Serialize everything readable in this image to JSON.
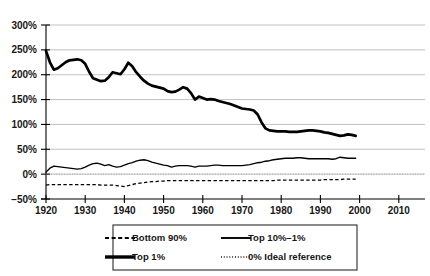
{
  "chart_data": {
    "type": "line",
    "title": "",
    "subtitle": "",
    "xlabel": "",
    "ylabel": "",
    "xlim": [
      1918,
      2012
    ],
    "ylim": [
      -50,
      300
    ],
    "grid": true,
    "legend_position": "bottom-center",
    "y_ticks": [
      {
        "value": 300,
        "label": "300%"
      },
      {
        "value": 250,
        "label": "250%"
      },
      {
        "value": 200,
        "label": "200%"
      },
      {
        "value": 150,
        "label": "150%"
      },
      {
        "value": 100,
        "label": "100%"
      },
      {
        "value": 50,
        "label": "50%"
      },
      {
        "value": 0,
        "label": "0%"
      },
      {
        "value": -50,
        "label": "−50%"
      }
    ],
    "x_ticks": [
      {
        "value": 1920,
        "label": "1920"
      },
      {
        "value": 1930,
        "label": "1930"
      },
      {
        "value": 1940,
        "label": "1940"
      },
      {
        "value": 1950,
        "label": "1950"
      },
      {
        "value": 1960,
        "label": "1960"
      },
      {
        "value": 1970,
        "label": "1970"
      },
      {
        "value": 1980,
        "label": "1980"
      },
      {
        "value": 1990,
        "label": "1990"
      },
      {
        "value": 2000,
        "label": "2000"
      },
      {
        "value": 2010,
        "label": "2010"
      }
    ],
    "series": [
      {
        "name": "Top 1%",
        "key": "top1",
        "style": "solid-thick",
        "x": [
          1920,
          1921,
          1922,
          1923,
          1924,
          1925,
          1926,
          1927,
          1928,
          1929,
          1930,
          1931,
          1932,
          1933,
          1934,
          1935,
          1936,
          1937,
          1938,
          1939,
          1940,
          1941,
          1942,
          1943,
          1944,
          1945,
          1946,
          1947,
          1948,
          1949,
          1950,
          1951,
          1952,
          1953,
          1954,
          1955,
          1956,
          1957,
          1958,
          1959,
          1960,
          1961,
          1962,
          1963,
          1964,
          1965,
          1966,
          1967,
          1968,
          1969,
          1970,
          1971,
          1972,
          1973,
          1974,
          1975,
          1976,
          1977,
          1978,
          1979,
          1980,
          1981,
          1982,
          1983,
          1984,
          1985,
          1986,
          1987,
          1988,
          1989,
          1990,
          1991,
          1992,
          1993,
          1994,
          1995,
          1996,
          1997,
          1998,
          1999
        ],
        "values": [
          248,
          225,
          210,
          213,
          219,
          225,
          229,
          230,
          231,
          229,
          222,
          206,
          193,
          190,
          187,
          188,
          195,
          205,
          203,
          201,
          211,
          224,
          217,
          205,
          196,
          188,
          182,
          178,
          176,
          174,
          172,
          167,
          165,
          166,
          170,
          175,
          172,
          163,
          150,
          156,
          153,
          150,
          151,
          150,
          147,
          145,
          143,
          141,
          138,
          135,
          132,
          131,
          130,
          128,
          120,
          104,
          92,
          88,
          87,
          86,
          86,
          86,
          85,
          85,
          85,
          86,
          87,
          88,
          88,
          87,
          86,
          84,
          83,
          81,
          79,
          77,
          78,
          80,
          79,
          77
        ]
      },
      {
        "name": "Top 10%–1%",
        "key": "top10_1",
        "style": "solid-thin",
        "x": [
          1920,
          1921,
          1922,
          1923,
          1924,
          1925,
          1926,
          1927,
          1928,
          1929,
          1930,
          1931,
          1932,
          1933,
          1934,
          1935,
          1936,
          1937,
          1938,
          1939,
          1940,
          1941,
          1942,
          1943,
          1944,
          1945,
          1946,
          1947,
          1948,
          1949,
          1950,
          1951,
          1952,
          1953,
          1954,
          1955,
          1956,
          1957,
          1958,
          1959,
          1960,
          1961,
          1962,
          1963,
          1964,
          1965,
          1966,
          1967,
          1968,
          1969,
          1970,
          1971,
          1972,
          1973,
          1974,
          1975,
          1976,
          1977,
          1978,
          1979,
          1980,
          1981,
          1982,
          1983,
          1984,
          1985,
          1986,
          1987,
          1988,
          1989,
          1990,
          1991,
          1992,
          1993,
          1994,
          1995,
          1996,
          1997,
          1998,
          1999
        ],
        "values": [
          4,
          12,
          16,
          15,
          14,
          13,
          12,
          11,
          10,
          11,
          14,
          18,
          21,
          22,
          20,
          17,
          19,
          16,
          14,
          15,
          18,
          21,
          23,
          26,
          28,
          29,
          27,
          24,
          22,
          20,
          18,
          17,
          14,
          16,
          17,
          17,
          17,
          16,
          14,
          16,
          16,
          16,
          17,
          18,
          18,
          17,
          17,
          17,
          17,
          17,
          17,
          18,
          19,
          21,
          23,
          24,
          26,
          27,
          29,
          30,
          31,
          32,
          32,
          32,
          33,
          33,
          32,
          31,
          31,
          31,
          31,
          31,
          31,
          30,
          31,
          34,
          33,
          32,
          32,
          32
        ]
      },
      {
        "name": "Bottom 90%",
        "key": "bottom90",
        "style": "dashed",
        "x": [
          1920,
          1921,
          1922,
          1923,
          1924,
          1925,
          1926,
          1927,
          1928,
          1929,
          1930,
          1931,
          1932,
          1933,
          1934,
          1935,
          1936,
          1937,
          1938,
          1939,
          1940,
          1941,
          1942,
          1943,
          1944,
          1945,
          1946,
          1947,
          1948,
          1949,
          1950,
          1951,
          1952,
          1953,
          1954,
          1955,
          1956,
          1957,
          1958,
          1959,
          1960,
          1961,
          1962,
          1963,
          1964,
          1965,
          1966,
          1967,
          1968,
          1969,
          1970,
          1971,
          1972,
          1973,
          1974,
          1975,
          1976,
          1977,
          1978,
          1979,
          1980,
          1981,
          1982,
          1983,
          1984,
          1985,
          1986,
          1987,
          1988,
          1989,
          1990,
          1991,
          1992,
          1993,
          1994,
          1995,
          1996,
          1997,
          1998,
          1999
        ],
        "values": [
          -22,
          -21,
          -21,
          -21,
          -21,
          -21,
          -21,
          -21,
          -21,
          -21,
          -21,
          -21,
          -21,
          -21,
          -22,
          -22,
          -22,
          -22,
          -23,
          -24,
          -25,
          -23,
          -21,
          -19,
          -18,
          -17,
          -16,
          -15,
          -15,
          -14,
          -14,
          -13,
          -13,
          -13,
          -13,
          -13,
          -13,
          -13,
          -13,
          -13,
          -13,
          -13,
          -13,
          -13,
          -13,
          -13,
          -13,
          -13,
          -13,
          -13,
          -13,
          -13,
          -13,
          -13,
          -13,
          -13,
          -13,
          -13,
          -13,
          -12,
          -12,
          -12,
          -12,
          -12,
          -12,
          -12,
          -12,
          -12,
          -12,
          -12,
          -12,
          -11,
          -11,
          -11,
          -11,
          -11,
          -10,
          -10,
          -10,
          -10
        ]
      },
      {
        "name": "0% Ideal reference",
        "key": "ideal_ref",
        "style": "dotted",
        "constant": 0
      }
    ]
  },
  "legend": {
    "entries": [
      {
        "label": "Bottom 90%",
        "style": "dashed",
        "marker": "dashed-line-swatch"
      },
      {
        "label": "Top 10%–1%",
        "style": "solid-thin",
        "marker": "thin-line-swatch"
      },
      {
        "label": "Top 1%",
        "style": "solid-thick",
        "marker": "thick-line-swatch"
      },
      {
        "label": "0% Ideal reference",
        "style": "dotted",
        "marker": "dotted-line-swatch"
      }
    ]
  },
  "colors": {
    "background": "#ffffff",
    "line": "#000000",
    "gridline": "#a8a8a8",
    "axis": "#000000",
    "text": "#171717"
  }
}
